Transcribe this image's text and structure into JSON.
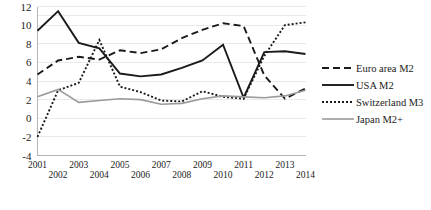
{
  "chart_data": {
    "type": "line",
    "title": "",
    "xlabel": "",
    "ylabel": "",
    "x": [
      2001,
      2002,
      2003,
      2004,
      2005,
      2006,
      2007,
      2008,
      2009,
      2010,
      2011,
      2012,
      2013,
      2014
    ],
    "xtick_labels": [
      "2001",
      "2002",
      "2003",
      "2004",
      "2005",
      "2006",
      "2007",
      "2008",
      "2009",
      "2010",
      "2011",
      "2012",
      "2013",
      "2014"
    ],
    "ytick_labels": [
      "12",
      "10",
      "8",
      "6",
      "4",
      "2",
      "0",
      "-2",
      "-4"
    ],
    "ytick_values": [
      12,
      10,
      8,
      6,
      4,
      2,
      0,
      -2,
      -4
    ],
    "ylim": [
      -4,
      12
    ],
    "xlim": [
      2001,
      2014
    ],
    "grid": true,
    "legend_position": "right",
    "series": [
      {
        "name": "Euro area M2",
        "style": "dashed",
        "color": "#1a1a1a",
        "values": [
          4.7,
          6.2,
          6.6,
          6.3,
          7.3,
          7.0,
          7.4,
          8.6,
          9.5,
          10.2,
          9.9,
          4.6,
          2.1,
          3.2
        ]
      },
      {
        "name": "USA M2",
        "style": "solid",
        "color": "#1a1a1a",
        "values": [
          9.4,
          11.5,
          8.1,
          7.5,
          4.8,
          4.5,
          4.7,
          5.4,
          6.2,
          7.9,
          2.2,
          7.1,
          7.2,
          6.9
        ]
      },
      {
        "name": "Switzerland M3",
        "style": "dotted",
        "color": "#1a1a1a",
        "values": [
          -2.0,
          3.0,
          3.8,
          8.4,
          3.4,
          2.8,
          1.9,
          1.8,
          2.9,
          2.3,
          2.1,
          6.7,
          10.0,
          10.3
        ]
      },
      {
        "name": "Japan M2+",
        "style": "solid",
        "color": "#9a9a9a",
        "values": [
          2.3,
          3.1,
          1.7,
          1.9,
          2.1,
          2.0,
          1.5,
          1.6,
          2.1,
          2.4,
          2.3,
          2.2,
          2.4,
          3.0
        ]
      }
    ]
  },
  "legend": {
    "items": [
      {
        "label": "Euro area M2"
      },
      {
        "label": "USA M2"
      },
      {
        "label": "Switzerland M3"
      },
      {
        "label": "Japan M2+"
      }
    ]
  }
}
